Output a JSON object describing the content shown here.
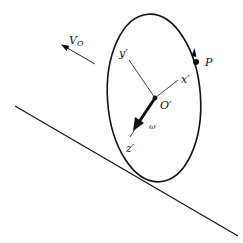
{
  "diagram": {
    "type": "rigid-body kinematics figure",
    "colors": {
      "ink": "#111111",
      "background": "#ffffff"
    },
    "labels": {
      "velocity": "V",
      "velocity_sub": "O",
      "point": "P",
      "center": "O′",
      "x_axis": "x′",
      "y_axis": "y′",
      "z_axis": "z′",
      "omega": "ω"
    },
    "elements": [
      {
        "id": "incline",
        "kind": "line",
        "from": [
          15,
          106
        ],
        "to": [
          238,
          236
        ]
      },
      {
        "id": "disk",
        "kind": "ellipse",
        "center": [
          154,
          98
        ],
        "rx": 47,
        "ry": 84,
        "rotation_deg": -4
      },
      {
        "id": "velocity-arrow",
        "kind": "arrow",
        "from": [
          95,
          64
        ],
        "to": [
          61,
          44
        ],
        "label": "V_O"
      },
      {
        "id": "y-axis",
        "kind": "line",
        "from": [
          155,
          98
        ],
        "to": [
          129,
          60
        ],
        "label": "y′"
      },
      {
        "id": "x-axis",
        "kind": "line",
        "from": [
          155,
          98
        ],
        "to": [
          179,
          80
        ],
        "label": "x′"
      },
      {
        "id": "z-axis",
        "kind": "thick-arrow",
        "from": [
          155,
          98
        ],
        "to": [
          134,
          130
        ],
        "label": "z′"
      },
      {
        "id": "point-P",
        "kind": "dot",
        "at": [
          196,
          62
        ],
        "label": "P"
      },
      {
        "id": "center-O",
        "kind": "dot",
        "at": [
          155,
          98
        ],
        "label": "O′"
      }
    ]
  }
}
